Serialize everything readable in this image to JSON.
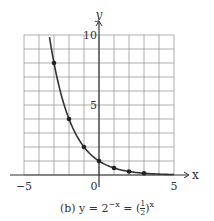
{
  "chart_data": {
    "type": "line",
    "caption_prefix": "(b) y = 2",
    "caption_exp1": "−x",
    "caption_mid": " = (",
    "caption_num": "1",
    "caption_den": "2",
    "caption_close": ")",
    "caption_exp2": "x",
    "xlabel": "x",
    "ylabel": "y",
    "xlim": [
      -5,
      5
    ],
    "ylim": [
      0,
      10
    ],
    "grid": true,
    "x_ticks": [
      "−5",
      "0",
      "5"
    ],
    "y_ticks": [
      "5",
      "10"
    ],
    "series": [
      {
        "name": "y = 2^-x",
        "curve_x_range": [
          -3.3,
          5
        ],
        "points": [
          {
            "x": -3,
            "y": 8
          },
          {
            "x": -2,
            "y": 4
          },
          {
            "x": -1,
            "y": 2
          },
          {
            "x": 0,
            "y": 1
          },
          {
            "x": 1,
            "y": 0.5
          },
          {
            "x": 2,
            "y": 0.25
          },
          {
            "x": 3,
            "y": 0.125
          }
        ]
      }
    ]
  }
}
